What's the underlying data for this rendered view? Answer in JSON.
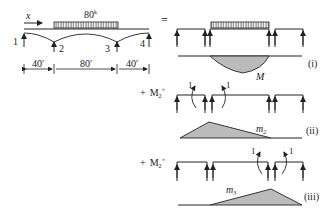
{
  "main_beam": {
    "load_label": "80",
    "load_unit_sup": "k",
    "x_label": "x",
    "support_labels": [
      "1",
      "2",
      "3",
      "4"
    ],
    "span_labels": [
      "40′",
      "80′",
      "40′"
    ],
    "equals": "="
  },
  "case_i": {
    "moment_label": "M",
    "tag": "(i)"
  },
  "case_ii": {
    "prefix": "+",
    "multiplier": "M",
    "multiplier_sub": "2",
    "times": "×",
    "unit_labels": [
      "1",
      "1"
    ],
    "moment_label": "m",
    "moment_sub": "2",
    "tag": "(ii)"
  },
  "case_iii": {
    "prefix": "+",
    "multiplier": "M",
    "multiplier_sub": "2",
    "times": "×",
    "unit_labels": [
      "1",
      "1"
    ],
    "moment_label": "m",
    "moment_sub": "3",
    "tag": "(iii)"
  }
}
